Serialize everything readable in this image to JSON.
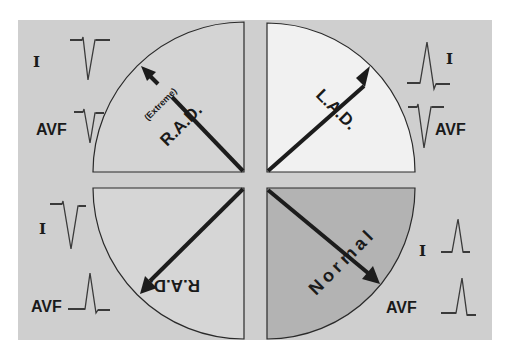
{
  "figure": {
    "background_color": "#cfcfcf",
    "page_color": "#ffffff"
  },
  "quadrants": {
    "extreme_rad": {
      "label": "R.A.D.",
      "qualifier": "(Extreme)",
      "fill": "#d4d4d4",
      "leads": {
        "i_label": "I",
        "avf_label": "AVF",
        "i_deflection": "negative",
        "avf_deflection": "negative"
      }
    },
    "lad": {
      "label": "L.A.D.",
      "fill": "#f1f1f1",
      "leads": {
        "i_label": "I",
        "avf_label": "AVF",
        "i_deflection": "positive",
        "avf_deflection": "negative"
      }
    },
    "rad": {
      "label": "R.A.D.",
      "fill": "#d6d6d6",
      "leads": {
        "i_label": "I",
        "avf_label": "AVF",
        "i_deflection": "negative",
        "avf_deflection": "positive"
      }
    },
    "normal": {
      "label": "Normal",
      "fill": "#b3b3b3",
      "leads": {
        "i_label": "I",
        "avf_label": "AVF",
        "i_deflection": "positive",
        "avf_deflection": "positive"
      }
    }
  }
}
